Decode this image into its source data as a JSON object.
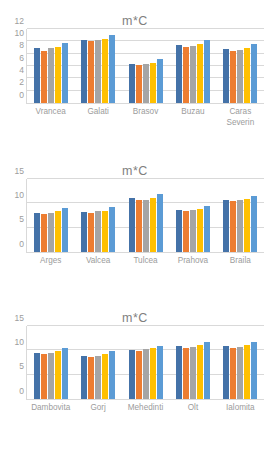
{
  "page": {
    "background": "#ffffff",
    "chart_count": 3
  },
  "palette": {
    "series_1": "#4472a8",
    "series_2": "#ed7d31",
    "series_3": "#a5a5a5",
    "series_4": "#ffc000",
    "series_5": "#5b9bd5",
    "gridline": "#d9d9d9",
    "axis_text": "#9c9c9c",
    "title_text": "#7f7f7f"
  },
  "chart_data": [
    {
      "id": "chart-1",
      "type": "bar",
      "title": "m*C",
      "xlabel": "",
      "ylabel": "",
      "ylim": [
        0,
        12
      ],
      "yticks": [
        12,
        10,
        8,
        6,
        4,
        2,
        0
      ],
      "grid": true,
      "legend": "none",
      "categories": [
        "Vrancea",
        "Galati",
        "Brasov",
        "Buzau",
        "Caras Severin"
      ],
      "series": [
        {
          "name": "Series 1",
          "color": "#4472a8",
          "values": [
            8.9,
            10.2,
            6.4,
            9.4,
            8.8
          ]
        },
        {
          "name": "Series 2",
          "color": "#ed7d31",
          "values": [
            8.5,
            10.0,
            6.2,
            9.1,
            8.4
          ]
        },
        {
          "name": "Series 3",
          "color": "#a5a5a5",
          "values": [
            8.9,
            10.2,
            6.3,
            9.3,
            8.6
          ]
        },
        {
          "name": "Series 4",
          "color": "#ffc000",
          "values": [
            9.1,
            10.4,
            6.5,
            9.6,
            8.9
          ]
        },
        {
          "name": "Series 5",
          "color": "#5b9bd5",
          "values": [
            9.7,
            11.1,
            7.1,
            10.2,
            9.6
          ]
        }
      ]
    },
    {
      "id": "chart-2",
      "type": "bar",
      "title": "m*C",
      "xlabel": "",
      "ylabel": "",
      "ylim": [
        0,
        15
      ],
      "yticks": [
        15,
        10,
        5,
        0
      ],
      "grid": true,
      "legend": "none",
      "categories": [
        "Arges",
        "Valcea",
        "Tulcea",
        "Prahova",
        "Braila"
      ],
      "series": [
        {
          "name": "Series 1",
          "color": "#4472a8",
          "values": [
            8.1,
            8.3,
            11.0,
            8.7,
            10.7
          ]
        },
        {
          "name": "Series 2",
          "color": "#ed7d31",
          "values": [
            7.9,
            8.0,
            10.6,
            8.4,
            10.5
          ]
        },
        {
          "name": "Series 3",
          "color": "#a5a5a5",
          "values": [
            8.1,
            8.4,
            10.7,
            8.6,
            10.6
          ]
        },
        {
          "name": "Series 4",
          "color": "#ffc000",
          "values": [
            8.4,
            8.5,
            11.1,
            8.9,
            10.9
          ]
        },
        {
          "name": "Series 5",
          "color": "#5b9bd5",
          "values": [
            9.1,
            9.2,
            11.9,
            9.5,
            11.6
          ]
        }
      ]
    },
    {
      "id": "chart-3",
      "type": "bar",
      "title": "m*C",
      "xlabel": "",
      "ylabel": "",
      "ylim": [
        0,
        15
      ],
      "yticks": [
        15,
        10,
        5,
        0
      ],
      "grid": true,
      "legend": "none",
      "categories": [
        "Dambovita",
        "Gorj",
        "Mehedinti",
        "Olt",
        "Ialomita"
      ],
      "series": [
        {
          "name": "Series 1",
          "color": "#4472a8",
          "values": [
            9.5,
            8.9,
            10.1,
            10.8,
            10.8
          ]
        },
        {
          "name": "Series 2",
          "color": "#ed7d31",
          "values": [
            9.2,
            8.6,
            9.8,
            10.5,
            10.5
          ]
        },
        {
          "name": "Series 3",
          "color": "#a5a5a5",
          "values": [
            9.4,
            8.8,
            10.2,
            10.7,
            10.7
          ]
        },
        {
          "name": "Series 4",
          "color": "#ffc000",
          "values": [
            9.8,
            9.2,
            10.4,
            11.1,
            11.0
          ]
        },
        {
          "name": "Series 5",
          "color": "#5b9bd5",
          "values": [
            10.4,
            9.8,
            10.9,
            11.7,
            11.8
          ]
        }
      ]
    }
  ]
}
